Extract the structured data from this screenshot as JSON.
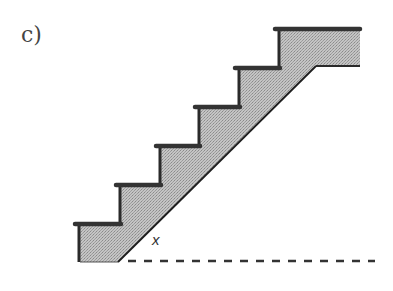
{
  "figure": {
    "panel_label": "c)",
    "angle_label": "x",
    "colors": {
      "fill": "#b8b8b8",
      "outline": "#2a2a2a",
      "tread": "#3a3a3a",
      "dashed": "#333333",
      "label": "#444444"
    },
    "staircase": {
      "step_count": 6,
      "treads": [
        {
          "step": 1,
          "x_left": 73,
          "y_top": 222
        },
        {
          "step": 2,
          "x_left": 114,
          "y_top": 183
        },
        {
          "step": 3,
          "x_left": 154,
          "y_top": 145
        },
        {
          "step": 4,
          "x_left": 193,
          "y_top": 106
        },
        {
          "step": 5,
          "x_left": 233,
          "y_top": 67
        },
        {
          "step": 6,
          "x_left": 273,
          "y_top": 28
        }
      ],
      "top_landing": {
        "x_right": 360,
        "y_top": 28,
        "y_bottom": 66
      },
      "stringer_diagonal": {
        "x1": 118,
        "y1": 262,
        "x2": 316,
        "y2": 66
      }
    },
    "ground_line": {
      "style": "dashed",
      "x1": 128,
      "x2": 374,
      "y": 261
    }
  }
}
